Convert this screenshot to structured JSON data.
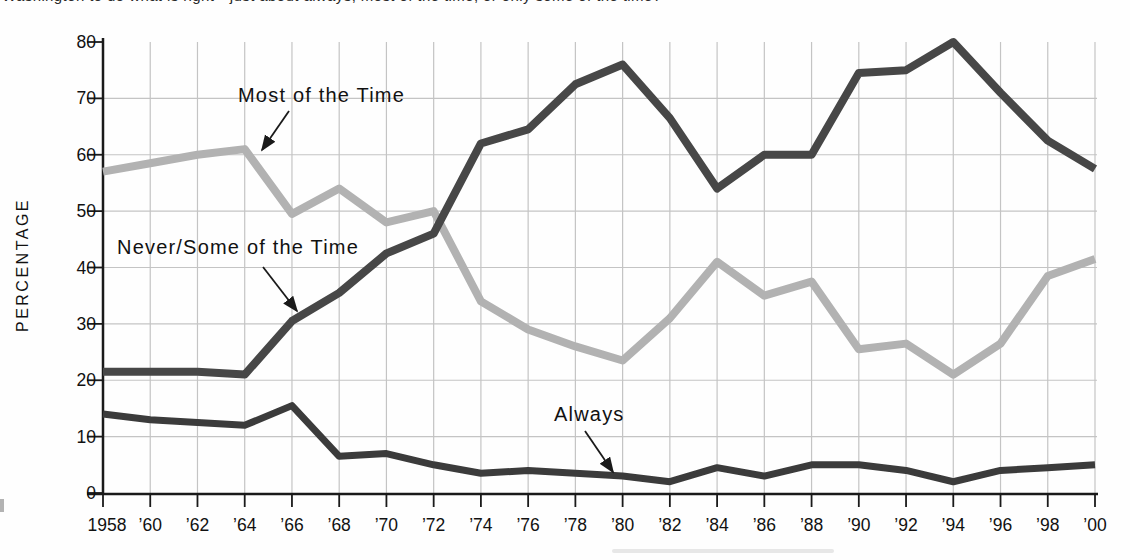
{
  "page": {
    "clipped_top_caption": "Washington to do what is right—just about always, most of the time, or only some of the time?"
  },
  "chart_data": {
    "type": "line",
    "title": "",
    "xlabel": "",
    "ylabel": "PERCENTAGE",
    "ylim": [
      0,
      80
    ],
    "ytick_step": 10,
    "grid": true,
    "legend_position": "inline-annotations",
    "axis_color": "#1a1a1a",
    "grid_color": "#c4c4c4",
    "x": [
      1958,
      1960,
      1962,
      1964,
      1966,
      1968,
      1970,
      1972,
      1974,
      1976,
      1978,
      1980,
      1982,
      1984,
      1986,
      1988,
      1990,
      1992,
      1994,
      1996,
      1998,
      2000
    ],
    "x_tick_labels": [
      "1958",
      "’60",
      "’62",
      "’64",
      "’66",
      "’68",
      "’70",
      "’72",
      "’74",
      "’76",
      "’78",
      "’80",
      "’82",
      "’84",
      "’86",
      "’88",
      "’90",
      "’92",
      "’94",
      "’96",
      "’98",
      "’00"
    ],
    "y_tick_labels": [
      "0",
      "10",
      "20",
      "30",
      "40",
      "50",
      "60",
      "70",
      "80"
    ],
    "series": [
      {
        "name": "Most of the Time",
        "color": "#b2b2b2",
        "values": [
          57,
          58.5,
          60,
          61,
          49.5,
          54,
          48,
          50,
          34,
          29,
          26,
          23.5,
          31,
          41,
          35,
          37.5,
          25.5,
          26.5,
          21,
          26.5,
          38.5,
          41.5
        ]
      },
      {
        "name": "Never/Some of the Time",
        "color": "#474747",
        "values": [
          21.5,
          21.5,
          21.5,
          21,
          30.5,
          35.5,
          42.5,
          46,
          62,
          64.5,
          72.5,
          76,
          66.5,
          54,
          60,
          60,
          74.5,
          75,
          80,
          71,
          62.5,
          57.5
        ]
      },
      {
        "name": "Always",
        "color": "#3b3b3b",
        "values": [
          14,
          13,
          12.5,
          12,
          15.5,
          6.5,
          7,
          5,
          3.5,
          4,
          3.5,
          3,
          2,
          4.5,
          3,
          5,
          5,
          4,
          2,
          4,
          4.5,
          5
        ]
      }
    ],
    "annotations": [
      {
        "label": "Most of the Time",
        "text_x": 238,
        "text_y": 102,
        "arrow_x1": 289,
        "arrow_y1": 111,
        "arrow_x2": 262,
        "arrow_y2": 150
      },
      {
        "label": "Never/Some of the Time",
        "text_x": 117,
        "text_y": 254,
        "arrow_x1": 263,
        "arrow_y1": 267,
        "arrow_x2": 297,
        "arrow_y2": 311
      },
      {
        "label": "Always",
        "text_x": 554,
        "text_y": 421,
        "arrow_x1": 585,
        "arrow_y1": 431,
        "arrow_x2": 613,
        "arrow_y2": 472
      }
    ]
  }
}
